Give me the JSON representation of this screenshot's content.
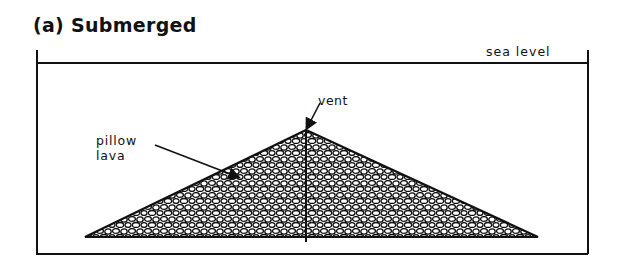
{
  "figure": {
    "title": "(a) Submerged",
    "labels": {
      "sea_level": "sea level",
      "vent": "vent",
      "pillow_lava_line1": "pillow",
      "pillow_lava_line2": "lava"
    },
    "colors": {
      "ink": "#111111",
      "background": "#ffffff"
    }
  }
}
